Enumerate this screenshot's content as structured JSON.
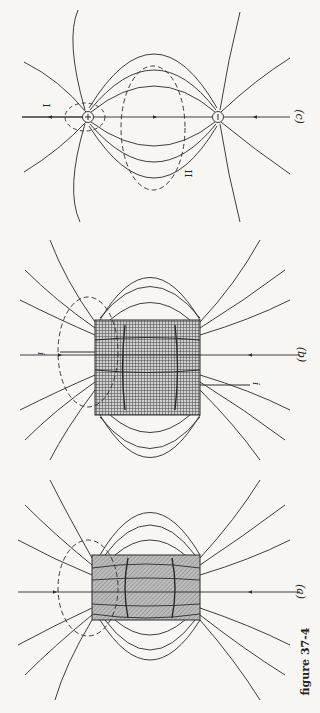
{
  "figure": {
    "caption": "figure 37-4",
    "orientation": "rotated 90° clockwise on page",
    "panels": [
      {
        "id": "a",
        "label": "(a)",
        "description": "Bar magnet with B field lines, dashed Gaussian surface around one end"
      },
      {
        "id": "b",
        "label": "(b)",
        "description": "Solenoid carrying current i with B field lines, dashed Gaussian surface around one end",
        "current_labels": [
          "i",
          "i"
        ]
      },
      {
        "id": "c",
        "label": "(c)",
        "description": "Electric dipole with E field lines; Gaussian surfaces I and II",
        "charges": [
          "+",
          "−"
        ],
        "surface_labels": [
          "I",
          "II"
        ]
      }
    ]
  },
  "colors": {
    "line": "#2a2a2a",
    "paper": "#f7f6f2",
    "fill_hatch": "#9a9a9a"
  }
}
